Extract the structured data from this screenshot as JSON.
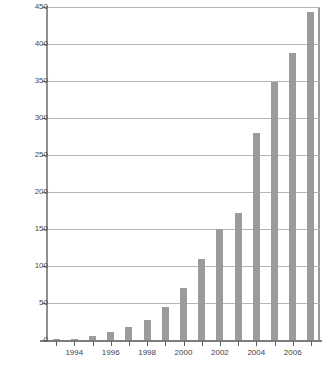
{
  "chart_data": {
    "type": "bar",
    "title": "",
    "subtitle": "",
    "xlabel": "",
    "ylabel": "",
    "categories": [
      "1993",
      "1994",
      "1995",
      "1996",
      "1997",
      "1998",
      "1999",
      "2000",
      "2001",
      "2002",
      "2003",
      "2004",
      "2005",
      "2006",
      "2007"
    ],
    "values": [
      1,
      2,
      5,
      11,
      18,
      27,
      44,
      70,
      110,
      150,
      172,
      280,
      348,
      388,
      443
    ],
    "x_tick_labels": [
      "1994",
      "1996",
      "1998",
      "2000",
      "2002",
      "2004",
      "2006"
    ],
    "x_tick_categories": [
      "1994",
      "1996",
      "1998",
      "2000",
      "2002",
      "2004",
      "2006"
    ],
    "y_ticks": [
      0,
      50,
      100,
      150,
      200,
      250,
      300,
      350,
      400,
      450
    ],
    "ylim": [
      0,
      450
    ],
    "grid": true,
    "legend": null,
    "series": [
      {
        "name": "",
        "values": [
          1,
          2,
          5,
          11,
          18,
          27,
          44,
          70,
          110,
          150,
          172,
          280,
          348,
          388,
          443
        ]
      }
    ],
    "colors": {
      "bar": "#9b9b9b",
      "gridline": "#b5b5b5",
      "axis": "#7d7d7d",
      "tick_label": "#3f3f3f",
      "plot_background": "#ffffff"
    }
  }
}
